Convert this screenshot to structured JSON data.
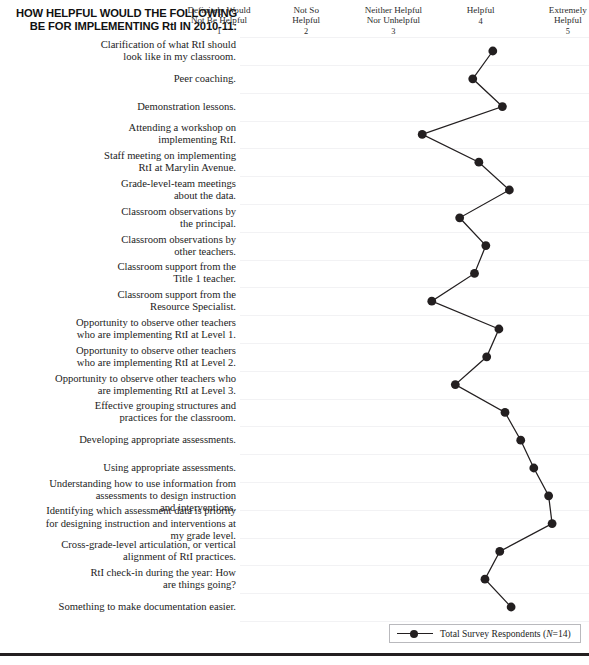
{
  "header": {
    "title": "HOW HELPFUL WOULD THE FOLLOWING BE FOR IMPLEMENTING RtI IN 2010-11:"
  },
  "legend": {
    "entry_label": "Total Survey Respondents (N=14)",
    "series_name": "Total Survey Respondents",
    "n_note": "(N=14)",
    "marker_color": "#231f20"
  },
  "chart_data": {
    "type": "line",
    "title": "HOW HELPFUL WOULD THE FOLLOWING BE FOR IMPLEMENTING RtI IN 2010-11:",
    "orientation": "horizontal-categories",
    "xlabel": "",
    "ylabel": "",
    "xlim": [
      1,
      5
    ],
    "grid": true,
    "legend_position": "bottom-right",
    "axis_position": "top",
    "tick_values": [
      1,
      2,
      3,
      4,
      5
    ],
    "tick_labels": [
      "Definitely Would\nNot Be Helpful",
      "Not So\nHelpful",
      "Neither Helpful\nNor Unhelpful",
      "Helpful",
      "Extremely\nHelpful"
    ],
    "tick_numbers": [
      "1",
      "2",
      "3",
      "4",
      "5"
    ],
    "categories": [
      "Clarification of what RtI should look like in my classroom.",
      "Peer coaching.",
      "Demonstration lessons.",
      "Attending a workshop on implementing RtI.",
      "Staff meeting on implementing RtI at Marylin Avenue.",
      "Grade-level-team meetings about the data.",
      "Classroom observations by the principal.",
      "Classroom observations by other teachers.",
      "Classroom support from the Title 1 teacher.",
      "Classroom support from the Resource Specialist.",
      "Opportunity to observe other teachers who are implementing RtI at Level 1.",
      "Opportunity to observe other teachers who are implementing RtI at Level 2.",
      "Opportunity to observe other teachers who are implementing RtI at Level 3.",
      "Effective grouping structures and practices for the classroom.",
      "Developing appropriate assessments.",
      "Using appropriate assessments.",
      "Understanding how to use information from assessments to design instruction and interventions.",
      "Identifying which assessment data is priority for designing instruction and interventions at my grade level.",
      "Cross-grade-level articulation, or vertical alignment of RtI practices.",
      "RtI check-in during the year: How are things going?",
      "Something to make documentation easier."
    ],
    "series": [
      {
        "name": "Total Survey Respondents (N=14)",
        "values": [
          4.14,
          3.91,
          4.25,
          3.33,
          3.98,
          4.33,
          3.76,
          4.06,
          3.93,
          3.44,
          4.21,
          4.07,
          3.71,
          4.28,
          4.46,
          4.61,
          4.78,
          4.82,
          4.22,
          4.05,
          4.35
        ]
      }
    ]
  },
  "items": [
    {
      "label": "Clarification of what RtI should\nlook like in my classroom.",
      "value": 4.14
    },
    {
      "label": "Peer coaching.",
      "value": 3.91
    },
    {
      "label": "Demonstration lessons.",
      "value": 4.25
    },
    {
      "label": "Attending a workshop on\nimplementing RtI.",
      "value": 3.33
    },
    {
      "label": "Staff meeting on implementing\nRtI at Marylin Avenue.",
      "value": 3.98
    },
    {
      "label": "Grade-level-team meetings\nabout the data.",
      "value": 4.33
    },
    {
      "label": "Classroom observations by\nthe principal.",
      "value": 3.76
    },
    {
      "label": "Classroom observations by\nother teachers.",
      "value": 4.06
    },
    {
      "label": "Classroom support from the\nTitle 1 teacher.",
      "value": 3.93
    },
    {
      "label": "Classroom support from the\nResource Specialist.",
      "value": 3.44
    },
    {
      "label": "Opportunity to observe other teachers\nwho are implementing RtI at Level 1.",
      "value": 4.21
    },
    {
      "label": "Opportunity to observe other teachers\nwho are implementing RtI at Level 2.",
      "value": 4.07
    },
    {
      "label": "Opportunity to observe other teachers who\nare implementing RtI at Level 3.",
      "value": 3.71
    },
    {
      "label": "Effective grouping structures and\npractices for the classroom.",
      "value": 4.28
    },
    {
      "label": "Developing appropriate assessments.",
      "value": 4.46
    },
    {
      "label": "Using appropriate assessments.",
      "value": 4.61
    },
    {
      "label": "Understanding how to use information from\nassessments to design instruction\nand interventions.",
      "value": 4.78
    },
    {
      "label": "Identifying which assessment data is priority\nfor designing instruction and interventions at\nmy grade level.",
      "value": 4.82
    },
    {
      "label": "Cross-grade-level articulation, or vertical\nalignment of RtI practices.",
      "value": 4.22
    },
    {
      "label": "RtI check-in during the year: How\nare things going?",
      "value": 4.05
    },
    {
      "label": "Something to make documentation easier.",
      "value": 4.35
    }
  ]
}
